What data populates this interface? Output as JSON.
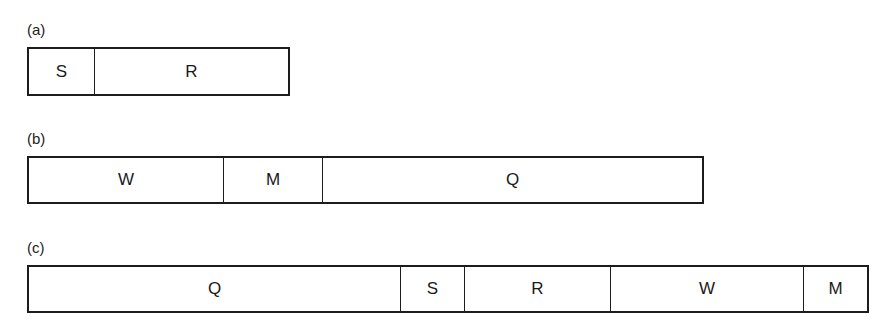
{
  "diagram": {
    "rows": [
      {
        "label": "(a)",
        "segments": [
          {
            "name": "S",
            "width": 66
          },
          {
            "name": "R",
            "width": 196
          }
        ]
      },
      {
        "label": "(b)",
        "segments": [
          {
            "name": "W",
            "width": 195
          },
          {
            "name": "M",
            "width": 99
          },
          {
            "name": "Q",
            "width": 382
          }
        ]
      },
      {
        "label": "(c)",
        "segments": [
          {
            "name": "Q",
            "width": 372
          },
          {
            "name": "S",
            "width": 64
          },
          {
            "name": "R",
            "width": 146
          },
          {
            "name": "W",
            "width": 193
          },
          {
            "name": "M",
            "width": 66
          }
        ]
      }
    ]
  }
}
